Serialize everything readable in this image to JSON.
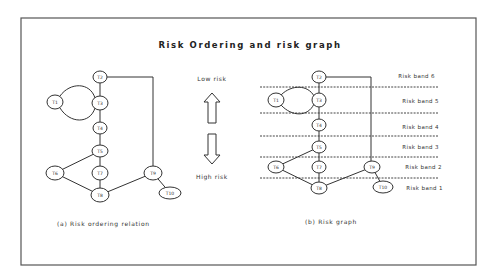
{
  "title": "Risk Ordering and risk graph",
  "legend": {
    "low_risk": "Low risk",
    "high_risk": "High risk",
    "up_arrow_icon": "arrow-up-icon",
    "down_arrow_icon": "arrow-down-icon"
  },
  "left_graph": {
    "caption": "(a) Risk ordering relation",
    "nodes": [
      {
        "id": "T1",
        "label": "T1"
      },
      {
        "id": "T2",
        "label": "T2"
      },
      {
        "id": "T3",
        "label": "T3"
      },
      {
        "id": "T4",
        "label": "T4"
      },
      {
        "id": "T5",
        "label": "T5"
      },
      {
        "id": "T6",
        "label": "T6"
      },
      {
        "id": "T7",
        "label": "T7"
      },
      {
        "id": "T8",
        "label": "T8"
      },
      {
        "id": "T9",
        "label": "T9"
      },
      {
        "id": "T10",
        "label": "T10"
      }
    ],
    "edges": [
      [
        "T2",
        "T3"
      ],
      [
        "T1",
        "T3"
      ],
      [
        "T3",
        "T1"
      ],
      [
        "T3",
        "T4"
      ],
      [
        "T4",
        "T5"
      ],
      [
        "T5",
        "T6"
      ],
      [
        "T5",
        "T7"
      ],
      [
        "T7",
        "T8"
      ],
      [
        "T6",
        "T8"
      ],
      [
        "T2",
        "T9"
      ],
      [
        "T9",
        "T8"
      ],
      [
        "T9",
        "T10"
      ]
    ]
  },
  "right_graph": {
    "caption": "(b) Risk graph",
    "bands": [
      "Risk band 6",
      "Risk band 5",
      "Risk band 4",
      "Risk band 3",
      "Risk band 2",
      "Risk band 1"
    ],
    "nodes": [
      {
        "id": "T1",
        "label": "T1"
      },
      {
        "id": "T2",
        "label": "T2"
      },
      {
        "id": "T3",
        "label": "T3"
      },
      {
        "id": "T4",
        "label": "T4"
      },
      {
        "id": "T5",
        "label": "T5"
      },
      {
        "id": "T6",
        "label": "T6"
      },
      {
        "id": "T7",
        "label": "T7"
      },
      {
        "id": "T8",
        "label": "T8"
      },
      {
        "id": "T9",
        "label": "T9"
      },
      {
        "id": "T10",
        "label": "T10"
      }
    ]
  }
}
